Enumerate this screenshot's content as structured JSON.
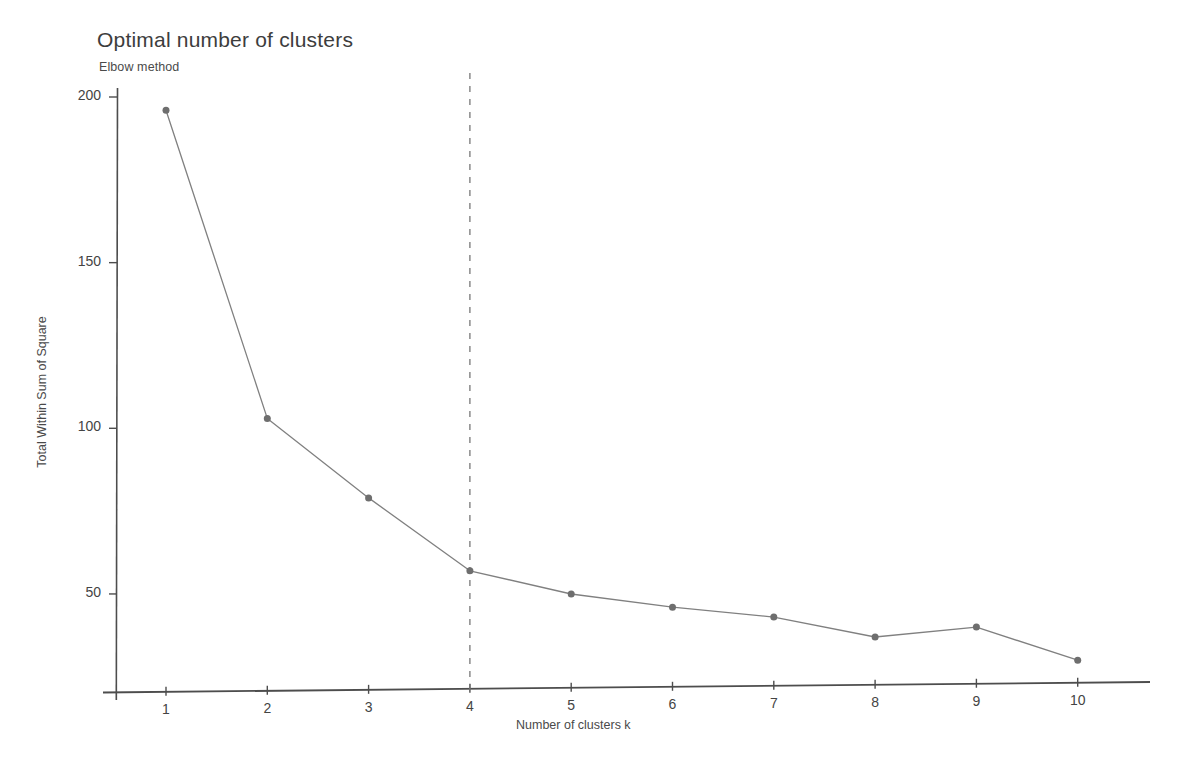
{
  "chart_data": {
    "type": "line",
    "title": "Optimal number of clusters",
    "subtitle": "Elbow method",
    "xlabel": "Number of clusters k",
    "ylabel": "Total Within Sum of Square",
    "x": [
      1,
      2,
      3,
      4,
      5,
      6,
      7,
      8,
      9,
      10
    ],
    "categories": [
      "1",
      "2",
      "3",
      "4",
      "5",
      "6",
      "7",
      "8",
      "9",
      "10"
    ],
    "values": [
      196,
      103,
      79,
      57,
      50,
      46,
      43,
      37,
      40,
      30
    ],
    "series": [
      {
        "name": "Total within sum of square",
        "values": [
          196,
          103,
          79,
          57,
          50,
          46,
          43,
          37,
          40,
          30
        ]
      }
    ],
    "xlim": [
      0.55,
      10.6
    ],
    "ylim": [
      22,
      205
    ],
    "xticks": [
      1,
      2,
      3,
      4,
      5,
      6,
      7,
      8,
      9,
      10
    ],
    "xtick_labels": [
      "1",
      "2",
      "3",
      "4",
      "5",
      "6",
      "7",
      "8",
      "9",
      "10"
    ],
    "yticks": [
      50,
      100,
      150,
      200
    ],
    "ytick_labels": [
      "50",
      "100",
      "150",
      "200"
    ],
    "grid": false,
    "legend": false,
    "annotations": [
      {
        "type": "vline",
        "name": "optimal-k-dashed-line",
        "x": 4,
        "style": "dashed",
        "color": "#777777"
      }
    ],
    "colors": {
      "line": "#808080",
      "marker": "#6e6e6e",
      "axis": "#4a4a4a",
      "dashed_line": "#7a7a7a",
      "background": "#ffffff",
      "text": "#3d3d3d"
    },
    "marker": "circle",
    "marker_size": 7,
    "line_width": 1.3
  }
}
